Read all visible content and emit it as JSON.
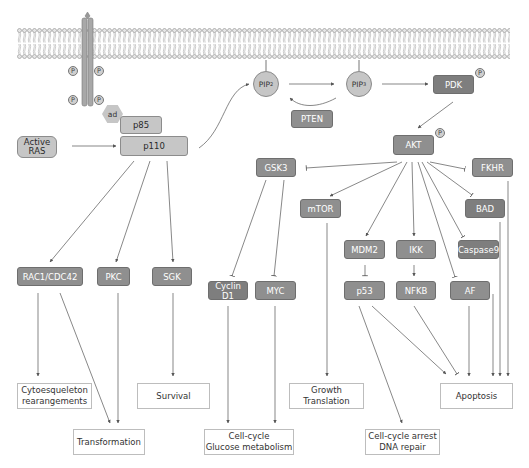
{
  "colors": {
    "node_fill": "#8f8f8f",
    "node_light_fill": "#c6c6c6",
    "outcome_border": "#bdbdbd",
    "arrow": "#555555",
    "membrane": "#9a9a9a"
  },
  "membrane": {
    "label": "cell-membrane"
  },
  "receptor": {
    "phospho_label": "P",
    "adaptor_label": "ad"
  },
  "pi3k": {
    "p85": "p85",
    "p110": "p110",
    "active_ras": "Active\nRAS"
  },
  "lipids": {
    "pip2": "PIP",
    "pip2_sub": "2",
    "pip3": "PIP",
    "pip3_sub": "3",
    "pten": "PTEN"
  },
  "kinases": {
    "pdk": "PDK",
    "akt": "AKT",
    "phospho_label": "P"
  },
  "akt_targets": {
    "gsk3": "GSK3",
    "mtor": "mTOR",
    "fkhr": "FKHR",
    "bad": "BAD",
    "mdm2": "MDM2",
    "ikk": "IKK",
    "caspase9": "Caspase9",
    "p53": "p53",
    "nfkb": "NFKB",
    "af": "AF",
    "cyclin_d1": "Cyclin D1",
    "myc": "MYC"
  },
  "p110_targets": {
    "rac1": "RAC1/CDC42",
    "pkc": "PKC",
    "sgk": "SGK"
  },
  "outcomes": {
    "cytoskeleton": "Cytoesqueleton\nrearangements",
    "survival": "Survival",
    "transformation": "Transformation",
    "cell_cycle_glucose": "Cell-cycle\nGlucose metabolism",
    "growth": "Growth\nTranslation",
    "cell_cycle_arrest": "Cell-cycle arrest\nDNA repair",
    "apoptosis": "Apoptosis"
  }
}
